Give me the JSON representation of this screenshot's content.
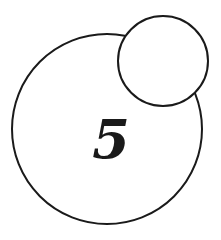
{
  "diagram": {
    "background": "#ffffff",
    "stroke_color": "#1a1a1a",
    "large_circle": {
      "cx": 107,
      "cy": 129,
      "r": 95,
      "fill": "#ffffff",
      "label": "5"
    },
    "small_circle": {
      "cx": 163,
      "cy": 61,
      "r": 45,
      "fill": "#ffffff",
      "label": ""
    }
  }
}
